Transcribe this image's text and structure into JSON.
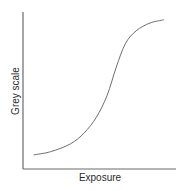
{
  "chart_data": {
    "type": "line",
    "title": "",
    "xlabel": "Exposure",
    "ylabel": "Grey scale",
    "grid": false,
    "legend": null,
    "x_ticks": [],
    "y_ticks": [],
    "xlim": [
      0,
      1
    ],
    "ylim": [
      0,
      1
    ],
    "series": [
      {
        "name": "characteristic curve",
        "color": "#6e6e6e",
        "x": [
          0.07,
          0.18,
          0.31,
          0.4,
          0.48,
          0.55,
          0.61,
          0.67,
          0.74,
          0.83,
          0.92
        ],
        "y": [
          0.09,
          0.11,
          0.16,
          0.23,
          0.33,
          0.47,
          0.65,
          0.8,
          0.88,
          0.93,
          0.95
        ]
      }
    ]
  },
  "axes": {
    "x_label": "Exposure",
    "y_label": "Grey scale"
  }
}
